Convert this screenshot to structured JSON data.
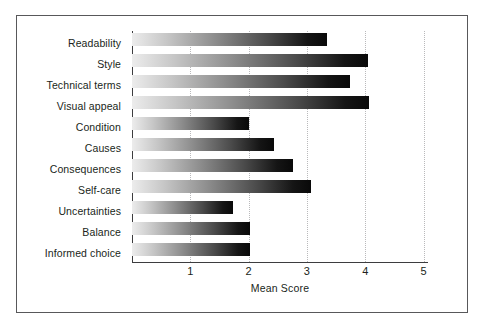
{
  "figure": {
    "frame_color": "#58585a",
    "background": "#ffffff"
  },
  "chart_data": {
    "type": "bar",
    "orientation": "horizontal",
    "title": "",
    "subtitle": "",
    "xlabel": "Mean Score",
    "ylabel": "",
    "xlim": [
      0,
      5
    ],
    "xticks": [
      1,
      2,
      3,
      4,
      5
    ],
    "xticklabels": [
      "1",
      "2",
      "3",
      "4",
      "5"
    ],
    "grid": "vertical dotted gridlines at each x tick",
    "legend": "none",
    "bar_style": {
      "fill": "horizontal gradient light-grey to black",
      "gradient_start": "#ececec",
      "gradient_end": "#090909"
    },
    "categories": [
      "Readability",
      "Style",
      "Technical terms",
      "Visual appeal",
      "Condition",
      "Causes",
      "Consequences",
      "Self-care",
      "Uncertainties",
      "Balance",
      "Informed choice"
    ],
    "values": [
      3.34,
      4.05,
      3.74,
      4.07,
      2.0,
      2.43,
      2.77,
      3.07,
      1.74,
      2.03,
      2.03
    ],
    "series": [
      {
        "name": "Mean Score",
        "values": [
          3.34,
          4.05,
          3.74,
          4.07,
          2.0,
          2.43,
          2.77,
          3.07,
          1.74,
          2.03,
          2.03
        ]
      }
    ]
  }
}
